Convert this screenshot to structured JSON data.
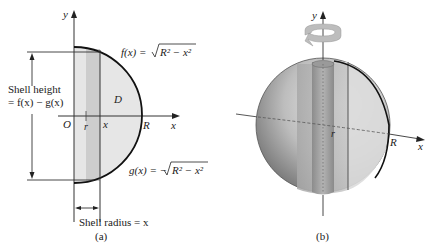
{
  "panel_a": {
    "caption": "(a)",
    "y_axis_label": "y",
    "x_axis_label": "x",
    "origin_label": "O",
    "r_label": "r",
    "x_tick_label": "x",
    "R_label": "R",
    "region_label": "D",
    "f_label": "f(x) = √R² − x²",
    "f_lhs": "f(x) = ",
    "f_radicand": "R² − x²",
    "g_lhs": "g(x) = −",
    "g_radicand": "R² − x²",
    "shell_height_line1": "Shell height",
    "shell_height_line2": "= f(x) − g(x)",
    "shell_radius": "Shell radius = x"
  },
  "panel_b": {
    "caption": "(b)",
    "y_axis_label": "y",
    "x_axis_label": "x",
    "r_label": "r",
    "R_label": "R"
  },
  "colors": {
    "region_fill": "#e4e4e4",
    "shell_fill": "#cfcfcf",
    "curve": "#111111",
    "axis": "#333333",
    "sphere_light": "#d9d9d9",
    "sphere_dark": "#7a7a7a"
  }
}
